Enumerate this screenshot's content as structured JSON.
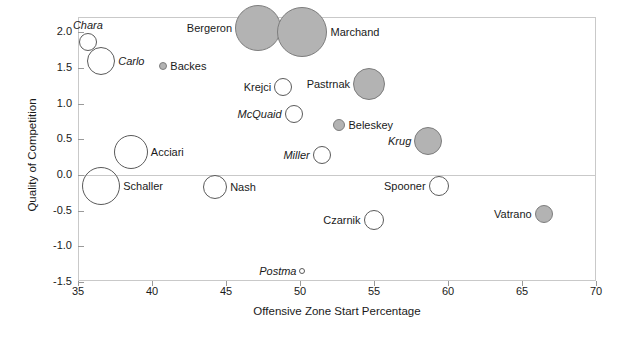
{
  "chart_data": {
    "type": "scatter",
    "title": "",
    "xlabel": "Offensive Zone Start Percentage",
    "ylabel": "Quality of Competition",
    "xlim": [
      35,
      70
    ],
    "ylim": [
      -1.5,
      2.2
    ],
    "xticks": [
      35,
      40,
      45,
      50,
      55,
      60,
      65,
      70
    ],
    "yticks": [
      2.0,
      1.5,
      1.0,
      0.5,
      0.0,
      -0.5,
      -1.0,
      -1.5
    ],
    "grid": false,
    "zero_line": 0.0,
    "legend": "none",
    "bubble_size_meaning": "time on ice",
    "colors": {
      "filled_fill": "#b3b3b3",
      "filled_stroke": "#7d7d7d",
      "open_stroke": "#5a5a5a",
      "frame": "#c9c9c9"
    },
    "points": [
      {
        "label": "Chara",
        "x": 35.6,
        "y": 1.86,
        "r": 9,
        "fill": "open",
        "italic": true,
        "labelpos": "above"
      },
      {
        "label": "Carlo",
        "x": 36.5,
        "y": 1.6,
        "r": 14,
        "fill": "open",
        "italic": true,
        "labelpos": "right"
      },
      {
        "label": "Backes",
        "x": 40.7,
        "y": 1.53,
        "r": 4,
        "fill": "filled",
        "italic": false,
        "labelpos": "right"
      },
      {
        "label": "Bergeron",
        "x": 47.1,
        "y": 2.06,
        "r": 23,
        "fill": "filled",
        "italic": false,
        "labelpos": "left"
      },
      {
        "label": "Marchand",
        "x": 50.1,
        "y": 2.0,
        "r": 25,
        "fill": "filled",
        "italic": false,
        "labelpos": "right"
      },
      {
        "label": "Krejci",
        "x": 48.8,
        "y": 1.23,
        "r": 9,
        "fill": "open",
        "italic": false,
        "labelpos": "left"
      },
      {
        "label": "Pastrnak",
        "x": 54.6,
        "y": 1.27,
        "r": 16,
        "fill": "filled",
        "italic": false,
        "labelpos": "left"
      },
      {
        "label": "McQuaid",
        "x": 49.5,
        "y": 0.85,
        "r": 9,
        "fill": "open",
        "italic": true,
        "labelpos": "left"
      },
      {
        "label": "Beleskey",
        "x": 52.6,
        "y": 0.7,
        "r": 6,
        "fill": "filled",
        "italic": false,
        "labelpos": "right"
      },
      {
        "label": "Krug",
        "x": 58.6,
        "y": 0.48,
        "r": 14,
        "fill": "filled",
        "italic": true,
        "labelpos": "left"
      },
      {
        "label": "Acciari",
        "x": 38.5,
        "y": 0.32,
        "r": 17,
        "fill": "open",
        "italic": false,
        "labelpos": "right"
      },
      {
        "label": "Miller",
        "x": 51.4,
        "y": 0.28,
        "r": 9,
        "fill": "open",
        "italic": true,
        "labelpos": "left"
      },
      {
        "label": "Schaller",
        "x": 36.5,
        "y": -0.15,
        "r": 19,
        "fill": "open",
        "italic": false,
        "labelpos": "right"
      },
      {
        "label": "Nash",
        "x": 44.2,
        "y": -0.17,
        "r": 12,
        "fill": "open",
        "italic": false,
        "labelpos": "right"
      },
      {
        "label": "Spooner",
        "x": 59.3,
        "y": -0.15,
        "r": 10,
        "fill": "open",
        "italic": false,
        "labelpos": "left"
      },
      {
        "label": "Czarnik",
        "x": 54.9,
        "y": -0.63,
        "r": 10,
        "fill": "open",
        "italic": false,
        "labelpos": "left"
      },
      {
        "label": "Vatrano",
        "x": 66.4,
        "y": -0.54,
        "r": 9,
        "fill": "filled",
        "italic": false,
        "labelpos": "left"
      },
      {
        "label": "Postma",
        "x": 50.1,
        "y": -1.35,
        "r": 3,
        "fill": "open",
        "italic": true,
        "labelpos": "left"
      }
    ]
  }
}
